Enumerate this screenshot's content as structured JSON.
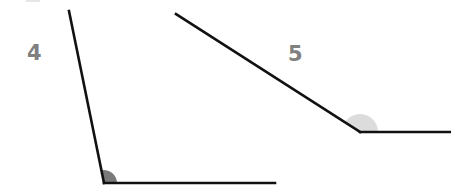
{
  "diagram": {
    "angles": [
      {
        "label": "4",
        "kind": "obtuse-ish steep angle",
        "marker_color": "#7a7a7a"
      },
      {
        "label": "5",
        "kind": "obtuse angle",
        "marker_color": "#dcdcdc"
      }
    ],
    "colors": {
      "line": "#111111",
      "label": "#808080",
      "background": "#ffffff"
    }
  }
}
